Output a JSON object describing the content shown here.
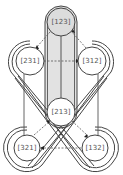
{
  "diagram": {
    "type": "permutation-graph",
    "colors": {
      "stroke": "#444444",
      "band_fill": "#e2e2e2",
      "top_node_fill": "#dcdcdc",
      "node_fill": "#ffffff",
      "dashed": "#555555",
      "label": "#555555"
    },
    "nodes": [
      {
        "id": "n123",
        "label": "[123]",
        "x": 61,
        "y": 22
      },
      {
        "id": "n231",
        "label": "[231]",
        "x": 30,
        "y": 61
      },
      {
        "id": "n312",
        "label": "[312]",
        "x": 92,
        "y": 61
      },
      {
        "id": "n213",
        "label": "[213]",
        "x": 61,
        "y": 112
      },
      {
        "id": "n321",
        "label": "[321]",
        "x": 27,
        "y": 148
      },
      {
        "id": "n132",
        "label": "[132]",
        "x": 95,
        "y": 148
      }
    ],
    "dashed_edges": [
      {
        "from": "[123]",
        "to": "[231]"
      },
      {
        "from": "[312]",
        "to": "[123]"
      },
      {
        "from": "[231]",
        "to": "[312]"
      },
      {
        "from": "[321]",
        "to": "[213]"
      },
      {
        "from": "[213]",
        "to": "[132]"
      },
      {
        "from": "[132]",
        "to": "[321]"
      }
    ]
  }
}
